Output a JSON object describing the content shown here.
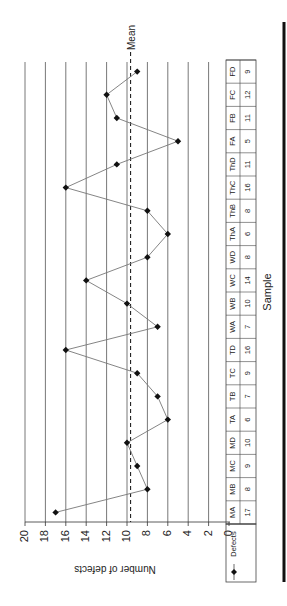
{
  "chart_data": {
    "type": "line",
    "orientation": "rotated-90",
    "title": "",
    "xlabel": "Sample",
    "ylabel": "Number of defects",
    "ylim": [
      0,
      20
    ],
    "yticks": [
      0,
      2,
      4,
      6,
      8,
      10,
      12,
      14,
      16,
      18,
      20
    ],
    "grid": true,
    "categories": [
      "MA",
      "MB",
      "MC",
      "MD",
      "TA",
      "TB",
      "TC",
      "TD",
      "WA",
      "WB",
      "WC",
      "WD",
      "ThA",
      "ThB",
      "ThC",
      "ThD",
      "FA",
      "FB",
      "FC",
      "FD"
    ],
    "series": [
      {
        "name": "Defects",
        "values": [
          17,
          8,
          9,
          10,
          6,
          7,
          9,
          16,
          7,
          10,
          14,
          8,
          6,
          8,
          16,
          11,
          5,
          11,
          12,
          9
        ]
      }
    ],
    "mean": {
      "label": "Mean",
      "value": 9.65
    },
    "legend": {
      "position": "table-left",
      "entries": [
        "Defects"
      ]
    }
  },
  "labels": {
    "mean": "Mean",
    "xlabel": "Sample",
    "ylabel": "Number of defects",
    "legend": "Defects"
  }
}
